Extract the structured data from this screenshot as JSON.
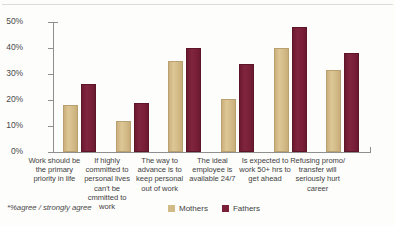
{
  "chart_data": {
    "type": "bar",
    "title": "",
    "subtitle": "",
    "xlabel": "",
    "ylabel": "",
    "ylim": [
      0,
      50
    ],
    "ytick_values": [
      0,
      10,
      20,
      30,
      40,
      50
    ],
    "ytick_labels": [
      "0%",
      "10%",
      "20%",
      "30%",
      "40%",
      "50%"
    ],
    "grid": false,
    "legend_position": "bottom-right",
    "categories": [
      "Work should be the primary priority in life",
      "If highly committed to personal lives can't be cmmitted to work",
      "The way to advance is to keep personal out of work",
      "The ideal employee is available 24/7",
      "Is expected to work 50+ hrs to get ahead",
      "Refusing promo/ transfer will seriously hurt career"
    ],
    "category_lines": [
      [
        "Work should be",
        "the primary",
        "priority in life"
      ],
      [
        "If highly",
        "committed to",
        "personal lives",
        "can't be",
        "cmmitted to",
        "work"
      ],
      [
        "The way to",
        "advance is to",
        "keep personal",
        "out of work"
      ],
      [
        "The ideal",
        "employee is",
        "available 24/7"
      ],
      [
        "Is expected  to",
        "work 50+ hrs to",
        "get ahead"
      ],
      [
        "Refusing promo/",
        "transfer will",
        "seriously hurt",
        "career"
      ]
    ],
    "series": [
      {
        "name": "Mothers",
        "color": "#d3bb87",
        "values": [
          18,
          12,
          35,
          20.5,
          40,
          31.5
        ]
      },
      {
        "name": "Fathers",
        "color": "#7a1f38",
        "values": [
          26,
          19,
          40,
          34,
          48,
          38
        ]
      }
    ],
    "annotations": [
      "*%agree / strongly agree"
    ]
  },
  "footnote": "*%agree / strongly agree",
  "legend": {
    "items": [
      {
        "label": "Mothers",
        "color": "#d3bb87"
      },
      {
        "label": "Fathers",
        "color": "#7a1f38"
      }
    ]
  }
}
